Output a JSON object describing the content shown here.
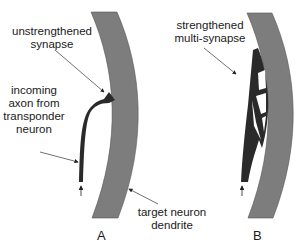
{
  "panels": {
    "a": {
      "letter": "A",
      "labels": {
        "synapse_l1": "unstrengthened",
        "synapse_l2": "synapse",
        "axon_l1": "incoming",
        "axon_l2": "axon from",
        "axon_l3": "transponder",
        "axon_l4": "neuron",
        "dendrite_l1": "target neuron",
        "dendrite_l2": "dendrite"
      }
    },
    "b": {
      "letter": "B",
      "labels": {
        "synapse_l1": "strengthened",
        "synapse_l2": "multi-synapse"
      }
    }
  },
  "colors": {
    "dendrite": "#7a7a7a",
    "axon": "#2b2b2b",
    "arrow": "#333333"
  }
}
